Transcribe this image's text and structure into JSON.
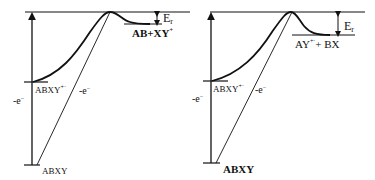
{
  "diagram": {
    "left_panel": {
      "reactant": "ABXY",
      "radical_cation": "ABXY",
      "radical_cation_charge": "+·",
      "vertical_arrow_label": "-e",
      "vertical_arrow_label_sup": "−",
      "diagonal_label": "-e",
      "diagonal_label_sup": "−",
      "product": "AB+XY",
      "product_sup": "+",
      "energy_label": "E",
      "energy_sub": "r"
    },
    "right_panel": {
      "reactant": "ABXY",
      "radical_cation": "ABXY",
      "radical_cation_charge": "+·",
      "vertical_arrow_label": "-e",
      "vertical_arrow_label_sup": "−",
      "diagonal_label": "-e",
      "diagonal_label_sup": "−",
      "product": "AY",
      "product_sup": "+·",
      "product_rest": "+ BX",
      "energy_label": "E",
      "energy_sub": "r"
    },
    "colors": {
      "line": "#111111",
      "background": "#ffffff"
    }
  }
}
